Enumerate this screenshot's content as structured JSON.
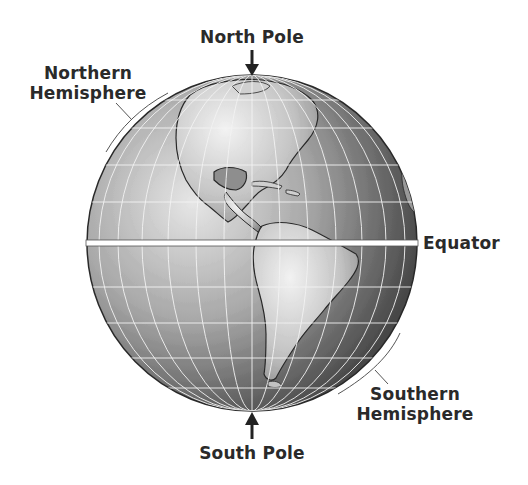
{
  "diagram": {
    "labels": {
      "north_pole": "North Pole",
      "south_pole": "South Pole",
      "equator": "Equator",
      "northern_hemisphere_line1": "Northern",
      "northern_hemisphere_line2": "Hemisphere",
      "southern_hemisphere_line1": "Southern",
      "southern_hemisphere_line2": "Hemisphere"
    },
    "colors": {
      "text": "#2a2a2a",
      "ocean_light": "#d9d9d9",
      "ocean_dark": "#3a3a3a",
      "land": "#bdbdbd",
      "grid": "#f2f2f2",
      "equator_line": "#ffffff"
    }
  }
}
